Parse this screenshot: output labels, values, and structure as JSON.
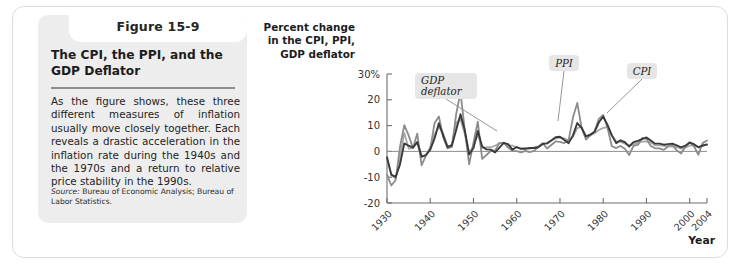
{
  "figure": {
    "number_label": "Figure 15-9",
    "title": "The CPI, the PPI, and the GDP Deflator",
    "body": "As the figure shows, these three different measures of inflation usually move closely together. Each reveals a drastic acceleration in the inflation rate during the 1940s and the 1970s and a return to relative price stability in the 1990s.",
    "source_label": "Source:",
    "source_text": " Bureau of Economic Analysis; Bureau of Labor Statistics."
  },
  "chart_data": {
    "type": "line",
    "title": "",
    "ylabel": "Percent change in the CPI, PPI, GDP deflator",
    "xlabel": "Year",
    "ylim": [
      -20,
      30
    ],
    "xlim": [
      1930,
      2004
    ],
    "ytick_labels": [
      "30%",
      "20",
      "10",
      "0",
      "-10",
      "-20"
    ],
    "ytick_values": [
      30,
      20,
      10,
      0,
      -10,
      -20
    ],
    "xtick_labels": [
      "1930",
      "1940",
      "1950",
      "1960",
      "1970",
      "1980",
      "1990",
      "2000",
      "2004"
    ],
    "xtick_values": [
      1930,
      1940,
      1950,
      1960,
      1970,
      1980,
      1990,
      2000,
      2004
    ],
    "grid": false,
    "legend_position": "inline-annotations",
    "annotations": [
      {
        "text": "GDP deflator",
        "series": "GDP deflator"
      },
      {
        "text": "PPI",
        "series": "PPI"
      },
      {
        "text": "CPI",
        "series": "CPI"
      }
    ],
    "x": [
      1930,
      1931,
      1932,
      1933,
      1934,
      1935,
      1936,
      1937,
      1938,
      1939,
      1940,
      1941,
      1942,
      1943,
      1944,
      1945,
      1946,
      1947,
      1948,
      1949,
      1950,
      1951,
      1952,
      1953,
      1954,
      1955,
      1956,
      1957,
      1958,
      1959,
      1960,
      1961,
      1962,
      1963,
      1964,
      1965,
      1966,
      1967,
      1968,
      1969,
      1970,
      1971,
      1972,
      1973,
      1974,
      1975,
      1976,
      1977,
      1978,
      1979,
      1980,
      1981,
      1982,
      1983,
      1984,
      1985,
      1986,
      1987,
      1988,
      1989,
      1990,
      1991,
      1992,
      1993,
      1994,
      1995,
      1996,
      1997,
      1998,
      1999,
      2000,
      2001,
      2002,
      2003,
      2004
    ],
    "series": [
      {
        "name": "CPI",
        "color": "#3a3a3a",
        "values": [
          -2.3,
          -9.0,
          -9.9,
          -5.1,
          3.1,
          2.2,
          1.5,
          3.6,
          -2.1,
          -1.4,
          0.7,
          5.0,
          10.9,
          6.1,
          1.7,
          2.3,
          8.3,
          14.4,
          8.1,
          -1.2,
          1.3,
          7.9,
          1.9,
          0.8,
          0.7,
          -0.4,
          1.5,
          3.3,
          2.8,
          0.7,
          1.7,
          1.0,
          1.0,
          1.3,
          1.3,
          1.6,
          2.9,
          3.1,
          4.2,
          5.5,
          5.7,
          4.4,
          3.2,
          6.2,
          11.0,
          9.1,
          5.8,
          6.5,
          7.6,
          11.3,
          13.5,
          10.3,
          6.2,
          3.2,
          4.3,
          3.6,
          1.9,
          3.6,
          4.1,
          4.8,
          5.4,
          4.2,
          3.0,
          3.0,
          2.6,
          2.8,
          3.0,
          2.3,
          1.6,
          2.2,
          3.4,
          2.8,
          1.6,
          2.3,
          2.7
        ]
      },
      {
        "name": "PPI",
        "color": "#8c8c8c",
        "values": [
          -9.0,
          -13.2,
          -11.1,
          1.7,
          10.2,
          6.2,
          1.3,
          6.9,
          -5.4,
          -1.6,
          0.8,
          11.0,
          13.5,
          5.5,
          1.2,
          1.7,
          14.5,
          22.9,
          8.1,
          -5.0,
          3.5,
          11.5,
          -2.9,
          -1.4,
          0.2,
          0.4,
          3.2,
          3.4,
          1.5,
          0.2,
          0.1,
          -0.4,
          0.2,
          -0.3,
          0.2,
          1.8,
          3.2,
          1.1,
          2.5,
          3.9,
          3.7,
          3.2,
          4.4,
          13.1,
          18.8,
          9.2,
          4.6,
          6.1,
          7.8,
          12.6,
          14.1,
          9.1,
          2.0,
          1.3,
          2.1,
          1.0,
          -1.4,
          2.1,
          2.5,
          5.2,
          4.9,
          2.1,
          1.2,
          1.2,
          0.6,
          1.9,
          2.6,
          0.4,
          -0.8,
          1.8,
          3.6,
          2.0,
          -1.3,
          3.2,
          4.2
        ]
      },
      {
        "name": "GDP deflator",
        "color": "#a8a8a8",
        "values": [
          -2.6,
          -9.3,
          -10.5,
          -2.2,
          7.2,
          1.1,
          1.3,
          3.6,
          -1.6,
          -1.6,
          1.6,
          6.6,
          9.4,
          6.9,
          2.0,
          2.5,
          11.1,
          12.4,
          6.6,
          -0.5,
          2.1,
          6.6,
          1.4,
          1.6,
          1.6,
          2.2,
          3.2,
          3.3,
          2.1,
          2.3,
          1.6,
          1.1,
          1.4,
          1.1,
          1.5,
          1.9,
          2.9,
          3.1,
          4.3,
          5.0,
          5.3,
          5.0,
          4.3,
          5.6,
          9.0,
          9.5,
          5.8,
          6.4,
          7.0,
          8.3,
          9.1,
          9.4,
          6.1,
          3.9,
          3.7,
          3.0,
          2.2,
          2.7,
          3.4,
          3.8,
          3.9,
          3.5,
          2.3,
          2.3,
          2.1,
          2.0,
          1.9,
          1.7,
          1.1,
          1.4,
          2.2,
          2.4,
          1.7,
          2.1,
          2.6
        ]
      }
    ]
  }
}
